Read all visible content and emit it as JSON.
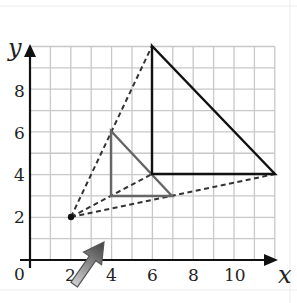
{
  "diagram": {
    "type": "enlargement-on-grid",
    "axes": {
      "x_label": "x",
      "y_label": "y",
      "origin_label": "0",
      "x_ticks": [
        "2",
        "4",
        "6",
        "8",
        "10"
      ],
      "y_ticks": [
        "2",
        "4",
        "6",
        "8"
      ],
      "x_range": [
        0,
        12
      ],
      "y_range": [
        0,
        10
      ]
    },
    "center_of_enlargement": {
      "x": 2,
      "y": 2
    },
    "object_triangle": {
      "vertices": [
        [
          4,
          6
        ],
        [
          4,
          3
        ],
        [
          7,
          3
        ]
      ],
      "color": "#555555"
    },
    "image_triangle": {
      "vertices": [
        [
          6,
          10
        ],
        [
          6,
          4
        ],
        [
          12,
          4
        ]
      ],
      "color": "#111111"
    },
    "construction_lines": [
      {
        "from": [
          2,
          2
        ],
        "to": [
          6,
          10
        ],
        "style": "dashed"
      },
      {
        "from": [
          2,
          2
        ],
        "to": [
          6,
          4
        ],
        "style": "dashed"
      },
      {
        "from": [
          2,
          2
        ],
        "to": [
          12,
          4
        ],
        "style": "dashed"
      }
    ],
    "pointer": {
      "type": "cursor-arrow",
      "at": [
        3.5,
        1
      ]
    },
    "colors": {
      "grid": "#c8c8c8",
      "axis": "#111111",
      "pointer_fill": "#808080"
    }
  }
}
